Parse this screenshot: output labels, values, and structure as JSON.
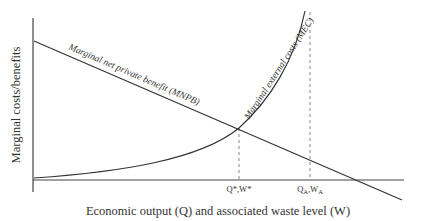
{
  "diagram": {
    "y_axis_label": "Marginal costs/benefits",
    "x_axis_label": "Economic output  (Q) and associated waste level (W)",
    "curves": {
      "mnpb": {
        "label": "Marginal net private benefit (MNPB)"
      },
      "mec": {
        "label": "Marginal external costs (MEC)"
      }
    },
    "markers": {
      "optimal": {
        "q": "Q*",
        "sep": ",",
        "w": "W*"
      },
      "private": {
        "q": "Q",
        "q_sub": "A",
        "sep": ",",
        "w": "W",
        "w_sub": "A"
      }
    },
    "colors": {
      "line": "#333333",
      "dashed": "#888888",
      "background": "#ffffff"
    }
  }
}
